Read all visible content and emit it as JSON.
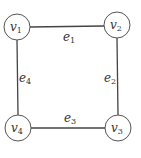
{
  "diagram": {
    "type": "cycle-graph",
    "nodes": [
      {
        "id": "v1",
        "label": "v",
        "sub": "1",
        "x": 17,
        "y": 27
      },
      {
        "id": "v2",
        "label": "v",
        "sub": "2",
        "x": 117,
        "y": 25
      },
      {
        "id": "v3",
        "label": "v",
        "sub": "3",
        "x": 118,
        "y": 128
      },
      {
        "id": "v4",
        "label": "v",
        "sub": "4",
        "x": 18,
        "y": 128
      }
    ],
    "edges": [
      {
        "id": "e1",
        "label": "e",
        "sub": "1",
        "from": "v1",
        "to": "v2"
      },
      {
        "id": "e2",
        "label": "e",
        "sub": "2",
        "from": "v2",
        "to": "v3"
      },
      {
        "id": "e3",
        "label": "e",
        "sub": "3",
        "from": "v3",
        "to": "v4"
      },
      {
        "id": "e4",
        "label": "e",
        "sub": "4",
        "from": "v4",
        "to": "v1"
      }
    ]
  }
}
